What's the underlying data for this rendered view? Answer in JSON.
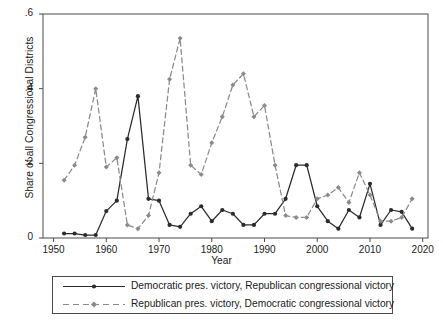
{
  "chart_data": {
    "type": "line",
    "title": "",
    "xlabel": "Year",
    "ylabel": "Share of all Congressional Districts",
    "xlim": [
      1948,
      2021
    ],
    "ylim": [
      0,
      0.6
    ],
    "xticks": [
      "1950",
      "1960",
      "1970",
      "1980",
      "1990",
      "2000",
      "2010",
      "2020"
    ],
    "xtick_values": [
      1950,
      1960,
      1970,
      1980,
      1990,
      2000,
      2010,
      2020
    ],
    "yticks": [
      "0",
      ".2",
      ".4",
      ".6"
    ],
    "ytick_values": [
      0,
      0.2,
      0.4,
      0.6
    ],
    "grid": false,
    "legend_position": "below-outside",
    "x": [
      1952,
      1954,
      1956,
      1958,
      1960,
      1962,
      1964,
      1966,
      1968,
      1970,
      1972,
      1974,
      1976,
      1978,
      1980,
      1982,
      1984,
      1986,
      1988,
      1990,
      1992,
      1994,
      1996,
      1998,
      2000,
      2002,
      2004,
      2006,
      2008,
      2010,
      2012,
      2014,
      2016,
      2018
    ],
    "series": [
      {
        "name": "Democratic pres. victory, Republican congressional victory",
        "style": "solid",
        "color": "#2b2b2b",
        "marker": "circle",
        "values": [
          0.012,
          0.012,
          0.008,
          0.008,
          0.072,
          0.1,
          0.265,
          0.38,
          0.105,
          0.1,
          0.035,
          0.03,
          0.065,
          0.085,
          0.045,
          0.075,
          0.065,
          0.035,
          0.035,
          0.065,
          0.065,
          0.105,
          0.195,
          0.195,
          0.085,
          0.045,
          0.025,
          0.075,
          0.055,
          0.145,
          0.035,
          0.075,
          0.07,
          0.025
        ]
      },
      {
        "name": "Republican pres. victory, Democratic congressional victory",
        "style": "dashed",
        "color": "#8a8a8a",
        "marker": "diamond",
        "values": [
          0.155,
          0.195,
          0.27,
          0.4,
          0.19,
          0.215,
          0.035,
          0.025,
          0.06,
          0.175,
          0.425,
          0.535,
          0.195,
          0.17,
          0.255,
          0.325,
          0.41,
          0.44,
          0.325,
          0.355,
          0.195,
          0.06,
          0.055,
          0.055,
          0.105,
          0.115,
          0.135,
          0.095,
          0.175,
          0.115,
          0.045,
          0.045,
          0.055,
          0.105
        ]
      }
    ]
  },
  "legend": {
    "entries": [
      {
        "label": "Democratic pres. victory, Republican congressional victory"
      },
      {
        "label": "Republican pres. victory, Democratic congressional victory"
      }
    ]
  },
  "colors": {
    "series1": "#2b2b2b",
    "series2": "#8a8a8a",
    "axis": "#4a4a4a",
    "background": "#ffffff"
  }
}
